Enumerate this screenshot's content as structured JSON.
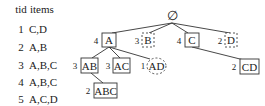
{
  "table": {
    "headers": {
      "tid": "tid",
      "items": "items"
    },
    "rows": [
      {
        "tid": "1",
        "items": "C,D"
      },
      {
        "tid": "2",
        "items": "A,B"
      },
      {
        "tid": "3",
        "items": "A,B,C"
      },
      {
        "tid": "4",
        "items": "A,B,C"
      },
      {
        "tid": "5",
        "items": "A,C,D"
      }
    ]
  },
  "tree": {
    "root": {
      "label": "∅"
    },
    "nodes": [
      {
        "id": "A",
        "label": "A",
        "support": "4",
        "style": "solid-box"
      },
      {
        "id": "B",
        "label": "B",
        "support": "3",
        "style": "dashed-box"
      },
      {
        "id": "C",
        "label": "C",
        "support": "4",
        "style": "solid-box"
      },
      {
        "id": "D",
        "label": "D",
        "support": "2",
        "style": "dashed-box"
      },
      {
        "id": "AB",
        "label": "AB",
        "support": "3",
        "style": "solid-box"
      },
      {
        "id": "AC",
        "label": "AC",
        "support": "3",
        "style": "solid-box"
      },
      {
        "id": "AD",
        "label": "AD",
        "support": "1",
        "style": "dashed-circle"
      },
      {
        "id": "ABC",
        "label": "ABC",
        "support": "2",
        "style": "solid-box"
      },
      {
        "id": "CD",
        "label": "CD",
        "support": "2",
        "style": "solid-box"
      }
    ],
    "edges": [
      [
        "root",
        "A"
      ],
      [
        "root",
        "B"
      ],
      [
        "root",
        "C"
      ],
      [
        "root",
        "D"
      ],
      [
        "A",
        "AB"
      ],
      [
        "A",
        "AC"
      ],
      [
        "A",
        "AD"
      ],
      [
        "AB",
        "ABC"
      ],
      [
        "C",
        "CD"
      ]
    ]
  }
}
